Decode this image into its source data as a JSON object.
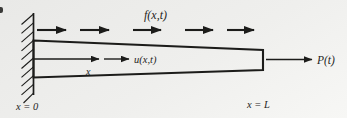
{
  "figure": {
    "labels": {
      "distributed_load": "f(x,t)",
      "displacement": "u(x,t)",
      "axis_coordinate": "x",
      "end_load": "P(t)",
      "left_end": "x = 0",
      "right_end": "x = L"
    },
    "colors": {
      "ink": "#1c1c1a",
      "background": "#efefed"
    }
  }
}
